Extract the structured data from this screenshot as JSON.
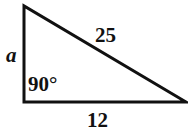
{
  "figure": {
    "kind": "right-triangle-diagram",
    "background_color": "#ffffff",
    "stroke_color": "#111111",
    "text_color": "#111111",
    "stroke_width": 3,
    "width": 188,
    "height": 139
  },
  "triangle": {
    "vertices": {
      "top_left": {
        "x": 24,
        "y": 6
      },
      "bottom_left": {
        "x": 24,
        "y": 102
      },
      "bottom_right": {
        "x": 186,
        "y": 102
      }
    }
  },
  "labels": {
    "vertical_leg": "a",
    "hypotenuse": "25",
    "horizontal_leg": "12",
    "right_angle": "90°"
  }
}
